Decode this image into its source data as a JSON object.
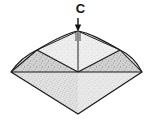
{
  "figure": {
    "kind": "line-drawing",
    "background_color": "#ffffff",
    "outline_color": "#1a1a1a",
    "fill_color": "#d8d8d8",
    "fill_color_light": "#e6e6e6",
    "fill_color_dark": "#c4c4c4",
    "texture": "stipple-grain",
    "annotation": {
      "label": "C",
      "label_color": "#141414",
      "pointer": "down-arrow",
      "points_to": "top-apex"
    },
    "geometry": {
      "top_apex": [
        78,
        31
      ],
      "left_vertex": [
        11,
        72
      ],
      "right_vertex": [
        142,
        72
      ],
      "bottom_apex": [
        78,
        114
      ],
      "crown_left_shoulder": [
        37,
        52
      ],
      "crown_right_shoulder": [
        120,
        52
      ],
      "girdle_y": 72
    }
  }
}
